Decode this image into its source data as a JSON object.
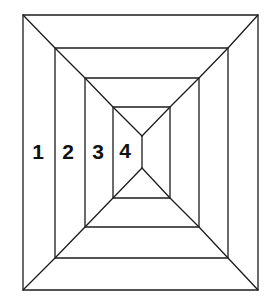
{
  "diagram": {
    "rectangles": [
      {
        "id": 1,
        "label": "1",
        "x1": 23,
        "y1": 15,
        "x2": 258,
        "y2": 290
      },
      {
        "id": 2,
        "label": "2",
        "x1": 55,
        "y1": 48,
        "x2": 228,
        "y2": 258
      },
      {
        "id": 3,
        "label": "3",
        "x1": 85,
        "y1": 78,
        "x2": 199,
        "y2": 227
      },
      {
        "id": 4,
        "label": "4",
        "x1": 113,
        "y1": 107,
        "x2": 170,
        "y2": 198
      }
    ],
    "center_segment": {
      "x": 142,
      "y_top": 136,
      "y_bottom": 168
    },
    "labels": [
      {
        "text": "1",
        "x": 38,
        "y": 151
      },
      {
        "text": "2",
        "x": 68,
        "y": 151
      },
      {
        "text": "3",
        "x": 98,
        "y": 151
      },
      {
        "text": "4",
        "x": 125,
        "y": 150
      }
    ],
    "colors": {
      "stroke": "#1c1c1c",
      "background": "#ffffff",
      "text": "#111111"
    }
  }
}
